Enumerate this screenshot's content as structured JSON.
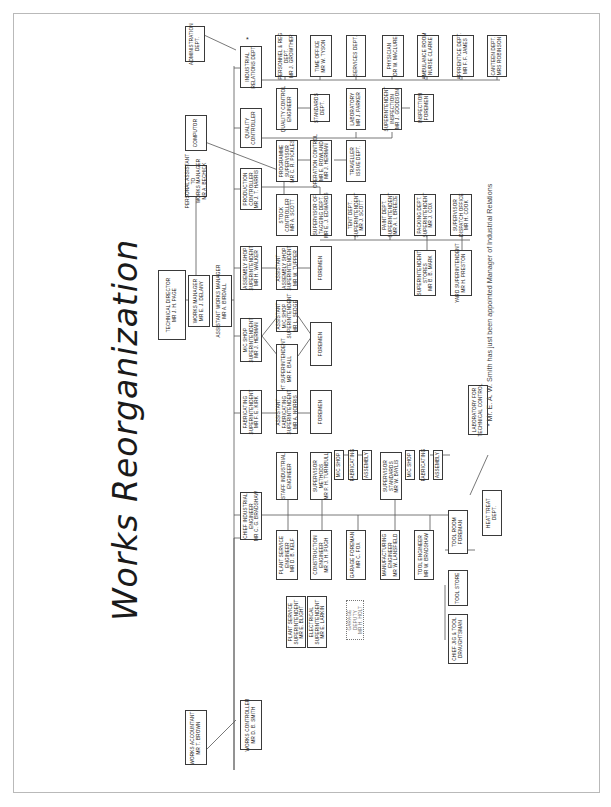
{
  "title": "Works Reorganization",
  "footnote": "* Mr. E. A. W. Smith has just been appointed Manager of Industrial Relations",
  "star": "*",
  "boxes": {
    "technical_director": "TECHNICAL DIRECTOR\nMR J. H. PAGE",
    "works_manager": "WORKS MANAGER\nMR E. J. DELANY",
    "assistant_works_manager": "ASSISTANT WORKS MANAGER\nMR A. BIRDALL",
    "personal_assistant": "PERSONAL ASSISTANT\nTO\nWORKS MANAGER\nMR A. BECHICK",
    "computor": "COMPUTOR",
    "administration_dept": "ADMINISTRATION\nDEPT.",
    "works_accountant": "WORKS ACCOUNTANT\nMR T. BROWN",
    "works_controller": "WORKS CONTROLLER\nMR D. B. SMITH",
    "chief_industrial_engineer": "CHIEF INDUSTRIAL\nENGINEER\nMR C. G. BRADSHAW",
    "fabricating_superintendent": "FABRICATING\nSUPERINTENDENT\nMR F. E. KIRK",
    "mc_shop_superintendent": "M/C SHOP\nSUPERINTENDENT\nMR J. HERMAN",
    "assembly_shop_superintendent": "ASSEMBLY SHOP\nSUPERINTENDENT\nMR H. WALKER",
    "production_controller": "PRODUCTION\nCONTROLLER\nMR J. T. HARRIS",
    "quality_controller": "QUALITY\nCONTROLLER",
    "industrial_relations_dept": "INDUSTRIAL\nRELATIONS DEPT.",
    "personnel_dept": "PERSONNEL & REG\nDEPT.\nMR J. GROWTHER",
    "time_office": "TIME OFFICE\nMR W. TYSON",
    "services_dept": "SERVICES DEPT.",
    "physician": "PHYSICIAN\nDR W. MACLURE",
    "ambulance_room": "AMBULANCE ROOM\nNURSE CLARKE",
    "apprentice_dept": "APPRENTICE DEPT.\nMR F. F. JAMES",
    "canteen_dept": "CANTEEN DEPT.\nMRS ROBINSON",
    "quality_control_engineer": "QUALITY CONTROL\nENGINEER",
    "standards_dept": "STANDARDS\nDEPT.",
    "laboratory": "LABORATORY\nMR J. PARKER",
    "superintendent_inspection": "SUPERINTENDENT\nINSPECTION\nMR J. GOODSON",
    "inspection_foremen": "INSPECTION\nFOREMEN",
    "programme_supervisor": "PROGRAMME\nSUPERVISOR\nMR C. R. PICKLES",
    "operation_control": "OPERATION CONTROL\nMR E. ROWLAND\nMR J. HERMAN",
    "traveller_dept": "TRAVELLER\nISSUE DEPT.",
    "stock_controller": "STOCK\nCONTROLLER\nMR A. SCOTT",
    "supervisor_tagging": "SUPERVISOR OF\nTAGGING DEPT.\nMR E. J. EDWARDS",
    "tent_dept": "TENT DEPT.\nSUPERINTENDENT\nMR J. SCOTT",
    "paint_dept": "PAINT DEPT.\nSUPERINTENDENT\nMR A. I. BREEZE",
    "packing_dept": "PACKING DEPT.\nSUPERINTENDENT\nMR J. COX",
    "dispatch_office": "SUPERVISOR\nDISPATCH OFFICE\nMR H. COOK",
    "superintendent_stores": "SUPERINTENDENT\nSTORES\nMR B. B. MARK",
    "yard_superintendent": "YARD SUPERINTENDENT\nMR H. PRESTON",
    "asst_assembly_shop": "ASSISTANT\nASSEMBLY SHOP\nSUPERINTENDENT\nMR W. TUPPER",
    "assembly_foremen": "FOREMEN",
    "asst_mc_shop": "ASSISTANT\nM/C SHOP\nSUPERINTENDENT\nMR L. SEDGE",
    "night_superintendent": "NIGHT SUPERINTENDENT\nMR F. BALL",
    "mc_foremen": "FOREMEN",
    "asst_fabricating": "ASSISTANT\nFABRICATING\nSUPERINTENDENT\nMR A. NORRIS",
    "fabricating_foremen": "FOREMEN",
    "staff_industrial_engineer": "STAFF INDUSTRIAL\nENGINEER",
    "supervisor_methods": "SUPERVISOR\nMETHODS\nMR P. H. TURNBULL",
    "methods_mc_shop": "M/C SHOP",
    "methods_fabricating": "FABRICATING",
    "methods_assembly": "ASSEMBLY",
    "supervisor_standards": "SUPERVISOR\nSTANDARDS\nMR W. BAYLIS",
    "standards_mc_shop": "M/C SHOP",
    "standards_fabricating": "FABRICATING",
    "standards_assembly": "ASSEMBLY",
    "plant_service_engineer": "PLANT SERVICE\nENGINEER\nMR D. B. KELF",
    "construction_engineer": "CONSTRUCTION\nENGINEER\nMR J. H. PUGH",
    "plant_service_superintendent": "PLANT SERVICE\nSUPERINTENDENT\nMR E. BLIGHT",
    "electrical_superintendent": "ELECTRICAL\nSUPERINTENDENT\nMR E. LARKIN",
    "garage_foreman": "GARAGE FOREMAN\nMR C. FOX",
    "garage_deputy": "GARAGE\nDEPUTY\nMR H. HOLT",
    "manufacturing_engineer": "MANUFACTURING\nENGINEER\nMR W. LANSFIELD",
    "tool_engineer": "TOOL ENGINEER\nMR W. BRADSHAW",
    "tool_room_foreman": "TOOL ROOM\nFOREMAN",
    "tool_store": "TOOL STORE",
    "chief_jig_tool": "CHIEF JIG & TOOL\nDRAUGHTSMAN",
    "heat_treat_dept": "HEAT TREAT\nDEPT.",
    "laboratory_technical_control": "LABORATORY FOR\nTECHNICAL CONTROL"
  }
}
